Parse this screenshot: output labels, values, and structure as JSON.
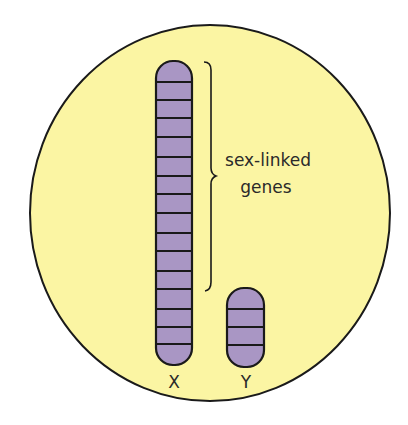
{
  "diagram": {
    "type": "sex-chromosomes",
    "colors": {
      "background": "#ffffff",
      "cell_fill": "#fbf5a3",
      "outline": "#1a1a1a",
      "chromosome_fill": "#a996c4"
    },
    "chromosomes": [
      {
        "id": "X",
        "label": "X",
        "band_count": 16
      },
      {
        "id": "Y",
        "label": "Y",
        "band_count": 4
      }
    ],
    "annotation": {
      "line1": "sex-linked",
      "line2": "genes"
    }
  }
}
